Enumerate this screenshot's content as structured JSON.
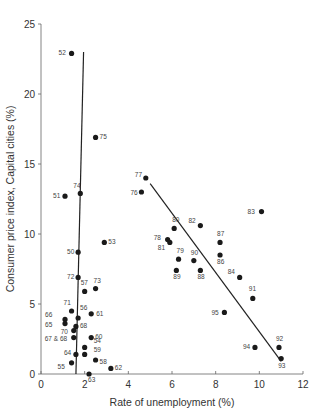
{
  "chart_data": {
    "type": "scatter",
    "title": "",
    "xlabel": "Rate of unemployment (%)",
    "ylabel": "Consumer price index, Capital cities (%)",
    "xlim": [
      0,
      12
    ],
    "ylim": [
      0,
      25
    ],
    "xticks": [
      0,
      2,
      4,
      6,
      8,
      10,
      12
    ],
    "yticks": [
      0,
      5,
      10,
      15,
      20,
      25
    ],
    "grid": false,
    "legend": null,
    "series": [
      {
        "name": "1950-1975",
        "points": [
          {
            "label": "52",
            "x": 1.4,
            "y": 22.9
          },
          {
            "label": "75",
            "x": 2.5,
            "y": 16.9
          },
          {
            "label": "74",
            "x": 1.8,
            "y": 12.9
          },
          {
            "label": "51",
            "x": 1.1,
            "y": 12.7
          },
          {
            "label": "53",
            "x": 2.9,
            "y": 9.4
          },
          {
            "label": "50",
            "x": 1.7,
            "y": 8.7
          },
          {
            "label": "72",
            "x": 1.7,
            "y": 6.9
          },
          {
            "label": "73",
            "x": 2.5,
            "y": 6.1
          },
          {
            "label": "57",
            "x": 2.0,
            "y": 5.9
          },
          {
            "label": "71",
            "x": 1.4,
            "y": 4.5
          },
          {
            "label": "61",
            "x": 2.3,
            "y": 4.3
          },
          {
            "label": "56",
            "x": 1.7,
            "y": 4.0
          },
          {
            "label": "66",
            "x": 1.1,
            "y": 3.9
          },
          {
            "label": "65",
            "x": 1.1,
            "y": 3.6
          },
          {
            "label": "68",
            "x": 1.6,
            "y": 3.4
          },
          {
            "label": "70",
            "x": 1.5,
            "y": 3.1
          },
          {
            "label": "67 & 68",
            "x": 1.5,
            "y": 2.6
          },
          {
            "label": "60",
            "x": 2.3,
            "y": 2.6
          },
          {
            "label": "54",
            "x": 2.0,
            "y": 1.9
          },
          {
            "label": "64",
            "x": 1.6,
            "y": 1.4
          },
          {
            "label": "59",
            "x": 2.0,
            "y": 1.4
          },
          {
            "label": "58",
            "x": 2.5,
            "y": 1.0
          },
          {
            "label": "55",
            "x": 1.4,
            "y": 0.8
          },
          {
            "label": "62",
            "x": 3.2,
            "y": 0.4
          },
          {
            "label": "63",
            "x": 2.2,
            "y": 0.0
          }
        ]
      },
      {
        "name": "1976-1995",
        "points": [
          {
            "label": "77",
            "x": 4.8,
            "y": 14.0
          },
          {
            "label": "76",
            "x": 4.6,
            "y": 13.0
          },
          {
            "label": "83",
            "x": 10.1,
            "y": 11.6
          },
          {
            "label": "82",
            "x": 7.3,
            "y": 10.6
          },
          {
            "label": "80",
            "x": 6.1,
            "y": 10.4
          },
          {
            "label": "78",
            "x": 5.8,
            "y": 9.6
          },
          {
            "label": "81",
            "x": 5.9,
            "y": 9.4
          },
          {
            "label": "87",
            "x": 8.2,
            "y": 9.4
          },
          {
            "label": "86",
            "x": 8.2,
            "y": 8.5
          },
          {
            "label": "79",
            "x": 6.3,
            "y": 8.2
          },
          {
            "label": "90",
            "x": 7.0,
            "y": 8.1
          },
          {
            "label": "89",
            "x": 6.2,
            "y": 7.4
          },
          {
            "label": "88",
            "x": 7.3,
            "y": 7.4
          },
          {
            "label": "84",
            "x": 9.1,
            "y": 6.9
          },
          {
            "label": "91",
            "x": 9.7,
            "y": 5.4
          },
          {
            "label": "95",
            "x": 8.4,
            "y": 4.4
          },
          {
            "label": "94",
            "x": 9.8,
            "y": 1.9
          },
          {
            "label": "92",
            "x": 10.9,
            "y": 1.9
          },
          {
            "label": "93",
            "x": 11.0,
            "y": 1.1
          }
        ]
      }
    ],
    "trend_lines": [
      {
        "name": "left-vertical-line",
        "from": [
          1.6,
          0
        ],
        "to": [
          1.95,
          23.0
        ]
      },
      {
        "name": "right-diagonal-line",
        "from": [
          5.0,
          13.6
        ],
        "to": [
          11.0,
          0.9
        ]
      }
    ],
    "label_offsets": {
      "52": [
        -13,
        2
      ],
      "75": [
        4,
        2
      ],
      "74": [
        -7,
        -5
      ],
      "51": [
        -12,
        2
      ],
      "53": [
        4,
        2
      ],
      "50": [
        -11,
        2
      ],
      "72": [
        -11,
        2
      ],
      "73": [
        -2,
        -6
      ],
      "57": [
        -4,
        -6
      ],
      "71": [
        -8,
        -6
      ],
      "61": [
        5,
        2
      ],
      "56": [
        2,
        -8
      ],
      "66": [
        -20,
        -2
      ],
      "65": [
        -20,
        3
      ],
      "68": [
        4,
        2
      ],
      "70": [
        -13,
        3
      ],
      "67 & 68": [
        -29,
        3
      ],
      "60": [
        4,
        1
      ],
      "54": [
        9,
        -4
      ],
      "64": [
        -12,
        1
      ],
      "59": [
        9,
        -2
      ],
      "58": [
        4,
        4
      ],
      "55": [
        -14,
        6
      ],
      "62": [
        4,
        2
      ],
      "63": [
        -1,
        8
      ],
      "77": [
        -11,
        -1
      ],
      "76": [
        -11,
        3
      ],
      "83": [
        -14,
        2
      ],
      "82": [
        -12,
        -3
      ],
      "80": [
        -2,
        -6
      ],
      "78": [
        -14,
        0
      ],
      "81": [
        -12,
        8
      ],
      "87": [
        -3,
        -6
      ],
      "86": [
        -3,
        9
      ],
      "79": [
        -2,
        -6
      ],
      "90": [
        -3,
        -6
      ],
      "89": [
        -3,
        9
      ],
      "88": [
        -3,
        9
      ],
      "84": [
        -12,
        -3
      ],
      "91": [
        -4,
        -7
      ],
      "95": [
        -13,
        3
      ],
      "94": [
        -12,
        2
      ],
      "92": [
        -3,
        -6
      ],
      "93": [
        -3,
        9
      ]
    }
  }
}
